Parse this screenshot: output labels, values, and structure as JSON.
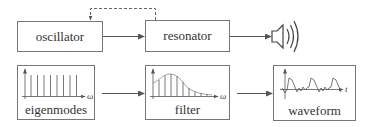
{
  "diagram": {
    "colors": {
      "stroke": "#666666",
      "text": "#333333",
      "background": "#ffffff"
    },
    "top_row": {
      "oscillator": {
        "label": "oscillator"
      },
      "resonator": {
        "label": "resonator"
      },
      "output_icon": "speaker-icon",
      "feedback": {
        "style": "dashed",
        "from": "resonator",
        "to": "oscillator"
      }
    },
    "bottom_row": {
      "eigenmodes": {
        "label": "eigenmodes",
        "axis_label": "ω",
        "spike_count": 8
      },
      "filter": {
        "label": "filter",
        "axis_label": "ω"
      },
      "waveform": {
        "label": "waveform",
        "axis_label": "t"
      }
    },
    "edges": [
      {
        "from": "oscillator",
        "to": "resonator",
        "style": "solid"
      },
      {
        "from": "resonator",
        "to": "speaker",
        "style": "solid"
      },
      {
        "from": "resonator",
        "to": "oscillator",
        "style": "dashed"
      },
      {
        "from": "eigenmodes",
        "to": "filter",
        "style": "solid"
      },
      {
        "from": "filter",
        "to": "waveform",
        "style": "solid"
      }
    ]
  }
}
